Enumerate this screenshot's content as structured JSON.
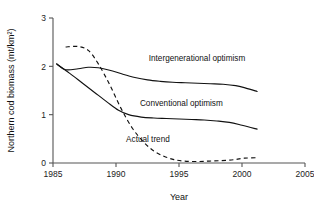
{
  "chart_data": {
    "type": "line",
    "title": "",
    "xlabel": "Year",
    "ylabel": "Northern cod biomass (mt/km²)",
    "xlim": [
      1985,
      2005
    ],
    "ylim": [
      0,
      3
    ],
    "xticks": [
      1985,
      1990,
      1995,
      2000,
      2005
    ],
    "xticklabels": [
      "1985",
      "1990",
      "1995",
      "2000",
      "2005"
    ],
    "yticks": [
      0,
      1,
      2,
      3
    ],
    "yticklabels": [
      "0",
      "1",
      "2",
      "3"
    ],
    "grid": false,
    "legend_position": "inline-annotations",
    "series": [
      {
        "name": "Intergenerational optimism",
        "style": "solid",
        "label_x": 1992.6,
        "label_y": 2.12,
        "x": [
          1985.3,
          1986,
          1987,
          1987.8,
          1988.6,
          1989.5,
          1990.5,
          1991.5,
          1992.5,
          1993.5,
          1994.5,
          1995.5,
          1996.5,
          1997.5,
          1998.5,
          1999.5,
          2000.3,
          2001.2
        ],
        "y": [
          2.05,
          1.93,
          1.95,
          1.98,
          1.97,
          1.92,
          1.84,
          1.77,
          1.72,
          1.69,
          1.67,
          1.66,
          1.65,
          1.64,
          1.63,
          1.6,
          1.55,
          1.48
        ]
      },
      {
        "name": "Conventional optimism",
        "style": "solid",
        "label_x": 1991.9,
        "label_y": 1.18,
        "x": [
          1985.3,
          1986.3,
          1987.3,
          1988.3,
          1989.3,
          1990.2,
          1991.0,
          1992.0,
          1993.0,
          1994.0,
          1995.0,
          1996.0,
          1997.0,
          1998.0,
          1999.0,
          2000.0,
          2001.2
        ],
        "y": [
          2.05,
          1.86,
          1.66,
          1.46,
          1.26,
          1.09,
          1.0,
          0.95,
          0.93,
          0.92,
          0.91,
          0.9,
          0.89,
          0.87,
          0.84,
          0.78,
          0.7
        ]
      },
      {
        "name": "Actual trend",
        "style": "dashed",
        "label_x": 1990.8,
        "label_y": 0.43,
        "x": [
          1986.0,
          1987.0,
          1987.8,
          1988.6,
          1989.5,
          1990.4,
          1991.3,
          1992.2,
          1993.0,
          1993.8,
          1994.6,
          1995.4,
          1996.4,
          1997.4,
          1998.4,
          1999.4,
          2000.2,
          2001.2
        ],
        "y": [
          2.4,
          2.41,
          2.33,
          2.05,
          1.62,
          1.13,
          0.72,
          0.43,
          0.25,
          0.14,
          0.07,
          0.04,
          0.03,
          0.04,
          0.05,
          0.07,
          0.1,
          0.11
        ]
      }
    ]
  }
}
